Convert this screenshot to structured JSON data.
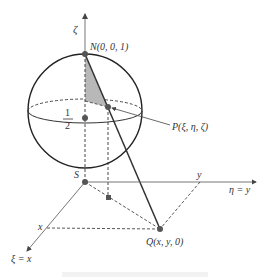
{
  "diagram": {
    "axes": {
      "zeta": "ζ",
      "eta": "η = y",
      "xi": "ξ = x",
      "x_tick": "x",
      "y_tick": "y"
    },
    "points": {
      "N": "N(0, 0, 1)",
      "S": "S",
      "P": "P(ξ, η, ζ)",
      "Q": "Q(x, y, 0)"
    },
    "center_label": {
      "numerator": "1",
      "denominator": "2"
    },
    "colors": {
      "line": "#333333",
      "axis": "#555555",
      "shade": "#b8b8b8",
      "point": "#555555"
    }
  }
}
